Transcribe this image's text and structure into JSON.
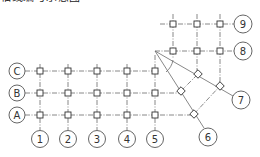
{
  "caption_fragment": "轴线编号示意图",
  "orthogonal_grid": {
    "columns": [
      {
        "label": "1",
        "x": 40
      },
      {
        "label": "2",
        "x": 68
      },
      {
        "label": "3",
        "x": 97
      },
      {
        "label": "4",
        "x": 127
      },
      {
        "label": "5",
        "x": 155
      }
    ],
    "rows": [
      {
        "label": "C",
        "y": 71
      },
      {
        "label": "B",
        "y": 93
      },
      {
        "label": "A",
        "y": 115
      }
    ]
  },
  "upper_grid": {
    "columns_x": [
      173,
      197,
      220
    ],
    "rows": [
      {
        "label": "9",
        "y": 24
      },
      {
        "label": "8",
        "y": 51
      }
    ]
  },
  "rotated_grid": {
    "labels": [
      "6",
      "7"
    ],
    "apex": [
      155,
      51
    ]
  },
  "colors": {
    "line": "#6a6a6a",
    "text": "#333333",
    "background": "#ffffff"
  }
}
